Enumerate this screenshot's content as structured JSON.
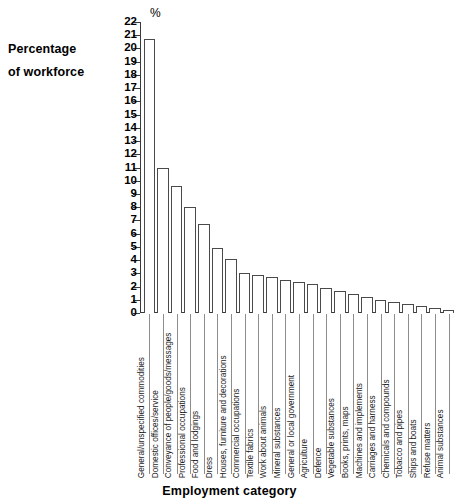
{
  "chart_data": {
    "type": "bar",
    "title": "",
    "ylabel": "Percentage of workforce",
    "xlabel": "Employment category",
    "unit_label": "%",
    "ylim": [
      0,
      22
    ],
    "ytick_step": 1,
    "grid": false,
    "legend": "none",
    "yticks": [
      "0",
      "1",
      "2",
      "3",
      "4",
      "5",
      "6",
      "7",
      "8",
      "9",
      "10",
      "11",
      "12",
      "13",
      "14",
      "15",
      "16",
      "17",
      "18",
      "19",
      "20",
      "21",
      "22"
    ],
    "categories": [
      "General/unspecified commodities",
      "Domestic offices/service",
      "Conveyance of people/goods/messages",
      "Professional occupations",
      "Food and lodgings",
      "Dress",
      "Houses, furniture and decorations",
      "Commercial occupations",
      "Textile fabrics",
      "Work about animals",
      "Mineral substances",
      "General or local government",
      "Agriculture",
      "Defence",
      "Vegetable substances",
      "Books, prints, maps",
      "Machines and implements",
      "Carriages and harness",
      "Chemicals and compounds",
      "Tobacco and pipes",
      "Ships and boats",
      "Refuse matters",
      "Animal substances"
    ],
    "values": [
      20.7,
      11.0,
      9.6,
      8.0,
      6.7,
      4.9,
      4.1,
      3.0,
      2.85,
      2.7,
      2.5,
      2.35,
      2.2,
      1.9,
      1.65,
      1.4,
      1.2,
      1.0,
      0.85,
      0.7,
      0.55,
      0.35,
      0.2
    ]
  },
  "axis_titles": {
    "y_line1": "Percentage",
    "y_line2": "of workforce",
    "x": "Employment category"
  },
  "colors": {
    "bar_fill": "#ffffff",
    "bar_stroke": "#4a4a4a",
    "axis": "#3a3a3a",
    "text": "#000000",
    "background": "#ffffff"
  }
}
